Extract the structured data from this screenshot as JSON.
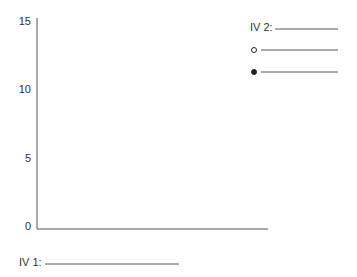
{
  "chart_data": {
    "type": "line",
    "title": "",
    "xlabel": "IV 1:",
    "ylabel": "",
    "ylim": [
      0,
      15
    ],
    "yticks": [
      0,
      5,
      10,
      15
    ],
    "ytick_labels": [
      "0",
      "5",
      "10",
      "15"
    ],
    "categories": [],
    "grid": false,
    "legend": {
      "placement": "top-right",
      "title": "IV 2:",
      "entries": [
        {
          "marker": "open-circle",
          "label": ""
        },
        {
          "marker": "filled-circle",
          "label": ""
        }
      ]
    },
    "series": []
  }
}
